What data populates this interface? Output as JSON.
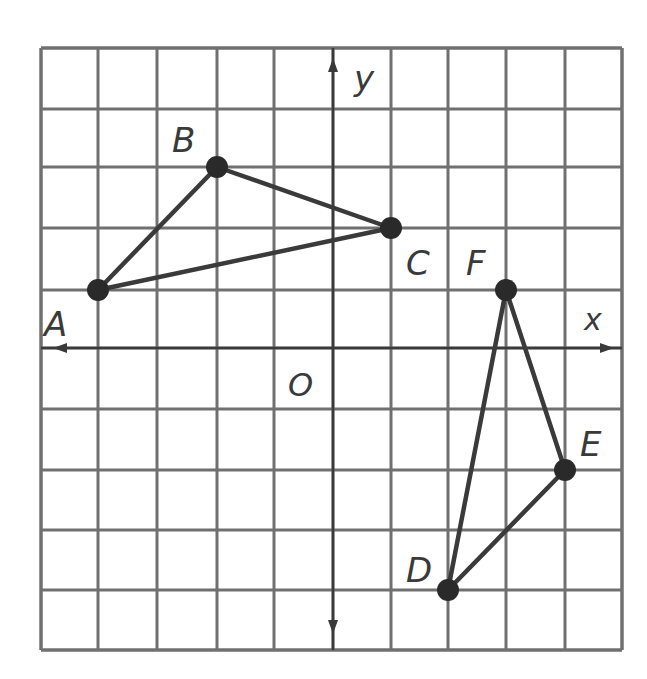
{
  "diagram": {
    "type": "coordinate-plane",
    "grid": {
      "columns": 10,
      "rows": 10,
      "origin_column_index": 5,
      "origin_row_index": 5,
      "x_range": [
        -5,
        5
      ],
      "y_range": [
        -5,
        5
      ],
      "line_color": "#6b6b6b"
    },
    "axes": {
      "x_label": "x",
      "y_label": "y",
      "origin_label": "O"
    },
    "colors": {
      "line": "#3a3a3a",
      "point": "#2a2a2a",
      "grid": "#707070",
      "label": "#3a3a3a"
    },
    "triangles": [
      {
        "name": "ABC",
        "vertices": [
          {
            "label": "A",
            "x": -4,
            "y": 1
          },
          {
            "label": "B",
            "x": -2,
            "y": 3
          },
          {
            "label": "C",
            "x": 1,
            "y": 2
          }
        ]
      },
      {
        "name": "DEF",
        "vertices": [
          {
            "label": "D",
            "x": 2,
            "y": -4
          },
          {
            "label": "E",
            "x": 4,
            "y": -2
          },
          {
            "label": "F",
            "x": 3,
            "y": 1
          }
        ]
      }
    ],
    "labels": {
      "A": "A",
      "B": "B",
      "C": "C",
      "D": "D",
      "E": "E",
      "F": "F"
    }
  }
}
